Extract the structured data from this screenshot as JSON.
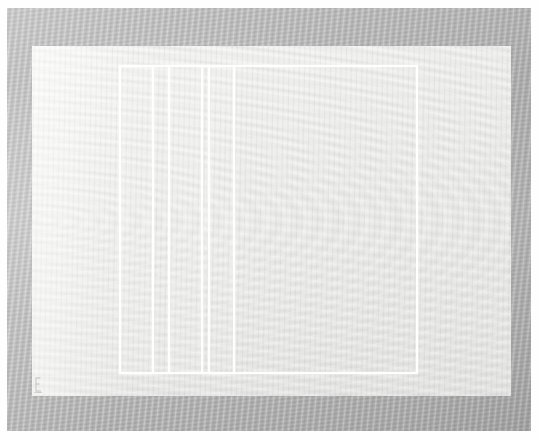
{
  "artwork": {
    "title": "Untitled (white ruled rectangle on gray paper)",
    "medium_appearance": "minimalist line drawing on textured paper with gray mat border",
    "orientation": "landscape",
    "canvas": {
      "width": 539,
      "height": 440,
      "units": "px"
    },
    "palette": {
      "outer_margin": "#ffffff",
      "frame_gray": "#b5b5b5",
      "frame_gray_light": "#c2c2c2",
      "frame_gray_dark": "#a6a6a6",
      "paper_light": "#f2f2f0",
      "paper_mid": "#ededeb",
      "paper_shadow": "#e6e6e4",
      "drawn_line": "#ffffff",
      "signature_graphite": "#8a8a8a"
    },
    "regions": {
      "frame": {
        "name": "mat-frame",
        "x": 7,
        "y": 8,
        "width": 524,
        "height": 423
      },
      "paper": {
        "name": "paper-sheet",
        "x": 32,
        "y": 46,
        "width": 479,
        "height": 350
      }
    },
    "composition": {
      "rectangle": {
        "label": "main-rectangle-outline",
        "x": 119,
        "y": 65,
        "width": 299,
        "height": 309,
        "stroke": "#ffffff",
        "stroke_width": 2
      },
      "vertical_lines": [
        {
          "label": "rule-1",
          "x": 152,
          "y_top": 65,
          "y_bottom": 374
        },
        {
          "label": "rule-2",
          "x": 168,
          "y_top": 65,
          "y_bottom": 374
        },
        {
          "label": "rule-3",
          "x": 201,
          "y_top": 65,
          "y_bottom": 374
        },
        {
          "label": "rule-4",
          "x": 208,
          "y_top": 65,
          "y_bottom": 374
        },
        {
          "label": "rule-5",
          "x": 233,
          "y_top": 65,
          "y_bottom": 374
        }
      ],
      "bands": [
        {
          "label": "band-a",
          "x": 121,
          "width": 31,
          "tone": "rgba(255,255,255,0.12)"
        },
        {
          "label": "band-b",
          "x": 154,
          "width": 14,
          "tone": "rgba(255,255,255,0.05)"
        },
        {
          "label": "band-c",
          "x": 170,
          "width": 31,
          "tone": "rgba(255,255,255,0.10)"
        },
        {
          "label": "band-d",
          "x": 203,
          "width": 5,
          "tone": "rgba(255,255,255,0.04)"
        },
        {
          "label": "band-e",
          "x": 210,
          "width": 23,
          "tone": "rgba(255,255,255,0.07)"
        },
        {
          "label": "band-f",
          "x": 235,
          "width": 181,
          "tone": "rgba(255,255,255,0.02)"
        }
      ],
      "signature": {
        "label": "pencil-signature-mark",
        "x": 33,
        "y": 376,
        "width": 13,
        "height": 17,
        "text": ""
      }
    },
    "counts": {
      "vertical_rules": 5,
      "rectangles": 1,
      "panels_inside_rectangle": 6
    }
  }
}
